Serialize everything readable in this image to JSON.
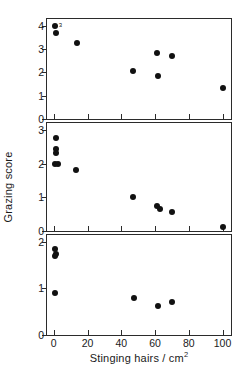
{
  "chart_data": {
    "type": "scatter",
    "title": "",
    "xlabel": "Stinging hairs / cm",
    "xlabel_superscript": "2",
    "ylabel": "Grazing score",
    "xlim": [
      -4,
      105
    ],
    "xticks": [
      0,
      20,
      40,
      60,
      80,
      100
    ],
    "xticklabels": [
      "0",
      "20",
      "40",
      "60",
      "80",
      "100"
    ],
    "grid": false,
    "legend": false,
    "panels": [
      {
        "name": "top-panel",
        "ylim": [
          0,
          4.3
        ],
        "yticks": [
          0,
          1,
          2,
          3,
          4
        ],
        "yticklabels": [
          "0",
          "1",
          "2",
          "3",
          "4"
        ],
        "points": [
          {
            "x": 0.5,
            "y": 4.0
          },
          {
            "x": 1.5,
            "y": 3.7
          },
          {
            "x": 14.0,
            "y": 3.25
          },
          {
            "x": 47.0,
            "y": 2.05
          },
          {
            "x": 61.0,
            "y": 2.82
          },
          {
            "x": 62.0,
            "y": 1.87
          },
          {
            "x": 70.0,
            "y": 2.72
          },
          {
            "x": 100.0,
            "y": 1.33
          }
        ],
        "annotations": [
          {
            "text": "3",
            "x": 3.0,
            "y": 4.05
          }
        ]
      },
      {
        "name": "middle-panel",
        "ylim": [
          0,
          3.2
        ],
        "yticks": [
          0,
          1,
          2,
          3
        ],
        "yticklabels": [
          "0",
          "1",
          "2",
          "3"
        ],
        "points": [
          {
            "x": 1.5,
            "y": 2.75
          },
          {
            "x": 1.5,
            "y": 2.42
          },
          {
            "x": 1.5,
            "y": 2.3
          },
          {
            "x": 0.5,
            "y": 1.99
          },
          {
            "x": 2.5,
            "y": 1.99
          },
          {
            "x": 13.0,
            "y": 1.82
          },
          {
            "x": 47.0,
            "y": 1.02
          },
          {
            "x": 61.0,
            "y": 0.73
          },
          {
            "x": 63.0,
            "y": 0.65
          },
          {
            "x": 70.0,
            "y": 0.55
          },
          {
            "x": 100.0,
            "y": 0.12
          }
        ],
        "annotations": []
      },
      {
        "name": "bottom-panel",
        "ylim": [
          0,
          2.15
        ],
        "yticks": [
          0,
          1,
          2
        ],
        "yticklabels": [
          "0",
          "1",
          "2"
        ],
        "points": [
          {
            "x": 1.0,
            "y": 1.85
          },
          {
            "x": 1.5,
            "y": 1.74
          },
          {
            "x": 1.0,
            "y": 1.69
          },
          {
            "x": 1.0,
            "y": 0.91
          },
          {
            "x": 47.5,
            "y": 0.8
          },
          {
            "x": 62.0,
            "y": 0.62
          },
          {
            "x": 70.0,
            "y": 0.71
          }
        ],
        "annotations": []
      }
    ]
  }
}
